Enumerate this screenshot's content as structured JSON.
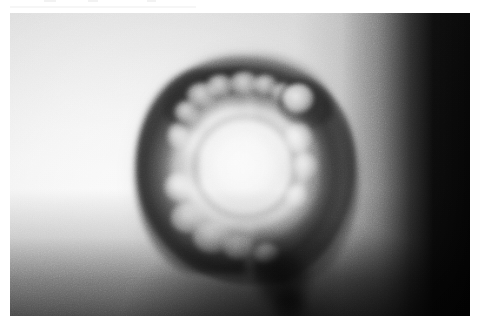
{
  "figure": {
    "kind": "grayscale-radiograph-photograph",
    "orientation": "landscape",
    "border": "white margin on all sides",
    "plate": {
      "left": 10,
      "top": 13,
      "width": 460,
      "height": 303
    }
  },
  "palette": {
    "page_background": "#ffffff",
    "plate_light": "#fdfdfd",
    "plate_mid": "#e3e3e3",
    "plate_dark": "#d6d6d6",
    "specimen_rim": "#2e2e2e",
    "specimen_core": "#ffffff",
    "right_band": "#000000",
    "shadow": "#0a0a0a"
  },
  "regions": {
    "background_field": "light gray, brightest toward the lower left",
    "right_edge_band": "solid black vertical band occupying the right ~12% of the plate",
    "bottom_shade": "progressive darkening toward the bottom of the plate",
    "specimen_body": "rounded polygonal mass, approximately centered slightly left of middle",
    "central_core": "diffuse bright circular core",
    "ring_system": "three to four concentric light and dark rings around the core",
    "upper_right_nodule": "small bright round nodule outlined by a darker rim",
    "bottom_protrusion": "dark stem-like projection extending below the body"
  },
  "artifacts": {
    "top_edge_marks": "faint light-gray scanner marks along the very top edge of the page"
  }
}
